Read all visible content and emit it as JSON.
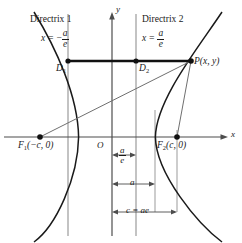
{
  "figure": {
    "colors": {
      "curve": "#1a1a1a",
      "axis": "#4d4d4d",
      "directrix": "#8c8c8c",
      "guide": "#9a9a9a",
      "segment": "#111111",
      "text": "#1a1a1a"
    }
  },
  "axes": {
    "x_label": "x",
    "y_label": "y",
    "origin_label": "O"
  },
  "directrix_left": {
    "name": "Directrix 1",
    "equation_lhs": "x =",
    "numerator": "a",
    "denominator": "e",
    "sign": "−"
  },
  "directrix_right": {
    "name": "Directrix 2",
    "equation_lhs": "x =",
    "numerator": "a",
    "denominator": "e"
  },
  "points": {
    "d1": "D",
    "d1_sub": "1",
    "d2": "D",
    "d2_sub": "2",
    "p": "P(x, y)",
    "f1": "F",
    "f1_sub": "1",
    "f1_coords": "(−c, 0)",
    "f2": "F",
    "f2_sub": "2",
    "f2_coords": "(c, 0)"
  },
  "measurements": [
    {
      "id": "a-over-e",
      "numerator": "a",
      "denominator": "e"
    },
    {
      "id": "a",
      "label": "a"
    },
    {
      "id": "c-equals-ae",
      "label": "c = ae"
    }
  ]
}
